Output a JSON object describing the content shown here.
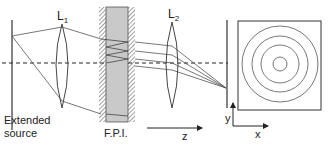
{
  "labels": {
    "lens1": "L",
    "lens1_sub": "1",
    "lens2": "L",
    "lens2_sub": "2",
    "source_line1": "Extended",
    "source_line2": "source",
    "fpi": "F.P.I.",
    "z_axis": "z",
    "x_axis": "x",
    "y_axis": "y"
  },
  "colors": {
    "line": "#555555",
    "slab": "#c9c9c9",
    "hatch": "#444444",
    "background": "#ffffff"
  },
  "fringe_pattern": {
    "rings": 4,
    "description": "concentric circular interference fringes"
  }
}
